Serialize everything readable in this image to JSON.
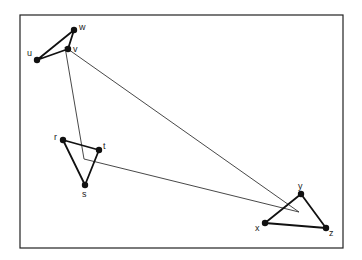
{
  "diagram": {
    "title": "",
    "frame": {
      "x": 20,
      "y": 15,
      "width": 323,
      "height": 233
    },
    "points": [
      {
        "id": "w",
        "label": "w",
        "x": 74,
        "y": 30,
        "lx": 79,
        "ly": 30
      },
      {
        "id": "v",
        "label": "v",
        "x": 68,
        "y": 49,
        "lx": 73,
        "ly": 52
      },
      {
        "id": "u",
        "label": "u",
        "x": 37,
        "y": 60,
        "lx": 27,
        "ly": 56
      },
      {
        "id": "r",
        "label": "r",
        "x": 63,
        "y": 140,
        "lx": 54,
        "ly": 140
      },
      {
        "id": "t",
        "label": "t",
        "x": 99,
        "y": 150,
        "lx": 103,
        "ly": 149
      },
      {
        "id": "s",
        "label": "s",
        "x": 85,
        "y": 185,
        "lx": 82,
        "ly": 197
      },
      {
        "id": "y",
        "label": "y",
        "x": 301,
        "y": 194,
        "lx": 298,
        "ly": 189
      },
      {
        "id": "x",
        "label": "x",
        "x": 265,
        "y": 223,
        "lx": 255,
        "ly": 231
      },
      {
        "id": "z",
        "label": "z",
        "x": 326,
        "y": 228,
        "lx": 329,
        "ly": 236
      }
    ],
    "triangles": [
      {
        "name": "uvw",
        "vertices": [
          "u",
          "v",
          "w"
        ]
      },
      {
        "name": "rst",
        "vertices": [
          "r",
          "s",
          "t"
        ]
      },
      {
        "name": "xyz",
        "vertices": [
          "x",
          "y",
          "z"
        ]
      }
    ],
    "connector_triangle": {
      "vertices": [
        [
          65,
          47
        ],
        [
          84,
          159
        ],
        [
          299,
          212
        ]
      ],
      "note": "thin triangle linking the three small triangles"
    },
    "colors": {
      "stroke": "#111111",
      "thin": "#333333",
      "frame": "#222222"
    }
  }
}
